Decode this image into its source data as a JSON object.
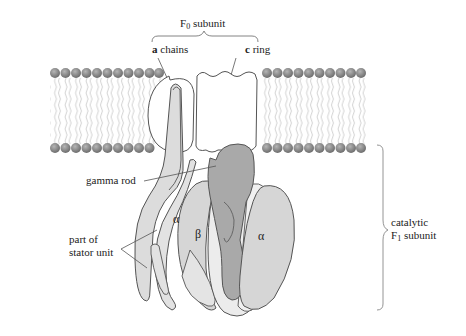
{
  "diagram": {
    "labels": {
      "f0_subunit_main": "F",
      "f0_subunit_sub": "0",
      "f0_subunit_rest": " subunit",
      "a_chains_bold": "a",
      "a_chains_rest": " chains",
      "c_ring_bold": "c",
      "c_ring_rest": " ring",
      "gamma_rod": "gamma rod",
      "stator_line1": "part of",
      "stator_line2": "stator unit",
      "catalytic_line1": "catalytic",
      "catalytic_f1_main": "F",
      "catalytic_f1_sub": "1",
      "catalytic_f1_rest": " subunit",
      "alpha_left": "α",
      "beta": "β",
      "alpha_right": "α"
    },
    "colors": {
      "lipid_head": "#8a8a8a",
      "outline": "#555555",
      "gamma_fill": "#a9a9a9",
      "alpha_fill": "#d6d6d6",
      "beta_fill": "#ececec",
      "stator_fill": "#dcdcdc"
    }
  }
}
